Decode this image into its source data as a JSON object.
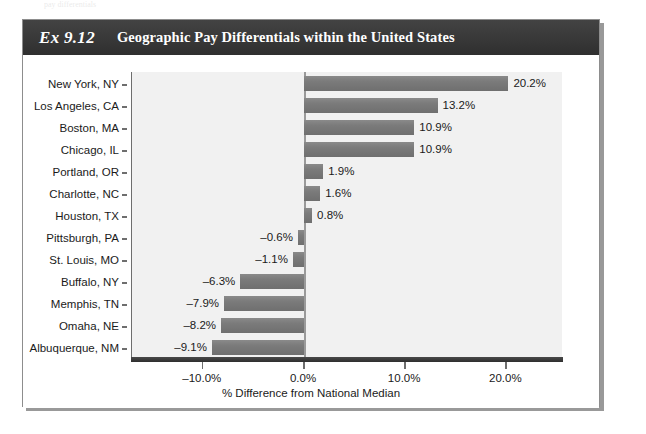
{
  "page": {
    "top_bleed_text": "pay  differentials"
  },
  "exhibit": {
    "number": "Ex 9.12",
    "title": "Geographic Pay Differentials within the United States"
  },
  "colors": {
    "header_band": "#3a3a3a",
    "bar_fill": "#7b7b7b",
    "plot_background": "#f1f1f1",
    "axis": "#6e6e6e",
    "text": "#1a1a1a"
  },
  "chart_data": {
    "type": "bar",
    "orientation": "horizontal",
    "title": "Geographic Pay Differentials within the United States",
    "xlabel": "% Difference from National Median",
    "ylabel": "",
    "xlim": [
      -17.0,
      25.5
    ],
    "xticks": [
      -10.0,
      0.0,
      10.0,
      20.0
    ],
    "xtick_labels": [
      "–10.0%",
      "0.0%",
      "10.0%",
      "20.0%"
    ],
    "grid": false,
    "legend": null,
    "categories": [
      "New York, NY",
      "Los Angeles, CA",
      "Boston, MA",
      "Chicago, IL",
      "Portland, OR",
      "Charlotte, NC",
      "Houston, TX",
      "Pittsburgh, PA",
      "St. Louis, MO",
      "Buffalo, NY",
      "Memphis, TN",
      "Omaha, NE",
      "Albuquerque, NM"
    ],
    "values": [
      20.2,
      13.2,
      10.9,
      10.9,
      1.9,
      1.6,
      0.8,
      -0.6,
      -1.1,
      -6.3,
      -7.9,
      -8.2,
      -9.1
    ],
    "data_labels": [
      "20.2%",
      "13.2%",
      "10.9%",
      "10.9%",
      "1.9%",
      "1.6%",
      "0.8%",
      "–0.6%",
      "–1.1%",
      "–6.3%",
      "–7.9%",
      "–8.2%",
      "–9.1%"
    ]
  }
}
